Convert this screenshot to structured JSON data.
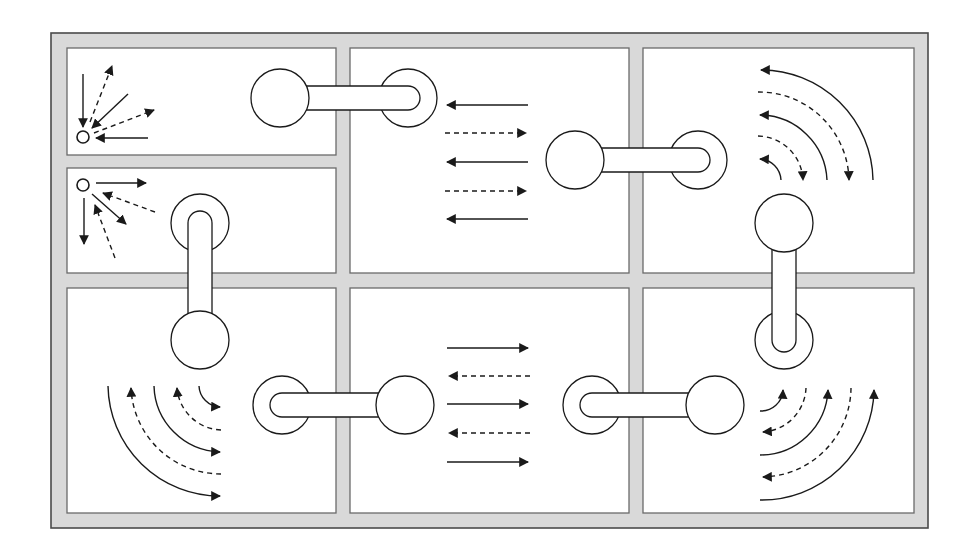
{
  "colors": {
    "background": "#ffffff",
    "frame_fill": "#d9d9d9",
    "frame_stroke": "#4a4a4a",
    "panel_fill": "#ffffff",
    "panel_stroke": "#6a6a6a",
    "line": "#1a1a1a"
  },
  "frame": {
    "x": 51,
    "y": 33,
    "w": 877,
    "h": 495
  },
  "panels": [
    {
      "id": "top-left-upper",
      "x": 67,
      "y": 48,
      "w": 269,
      "h": 107
    },
    {
      "id": "top-left-lower",
      "x": 67,
      "y": 168,
      "w": 269,
      "h": 105
    },
    {
      "id": "top-middle",
      "x": 350,
      "y": 48,
      "w": 279,
      "h": 225
    },
    {
      "id": "top-right",
      "x": 643,
      "y": 48,
      "w": 271,
      "h": 225
    },
    {
      "id": "bottom-left",
      "x": 67,
      "y": 288,
      "w": 269,
      "h": 225
    },
    {
      "id": "bottom-middle",
      "x": 350,
      "y": 288,
      "w": 279,
      "h": 225
    },
    {
      "id": "bottom-right",
      "x": 643,
      "y": 288,
      "w": 271,
      "h": 225
    }
  ],
  "rods": [
    {
      "id": "rod-top-horizontal-left",
      "orientation": "h",
      "ball": [
        280,
        98
      ],
      "ring": [
        408,
        98
      ],
      "r": 29,
      "half_width": 12
    },
    {
      "id": "rod-top-horizontal-right",
      "orientation": "h",
      "ball": [
        575,
        160
      ],
      "ring": [
        698,
        160
      ],
      "r": 29,
      "half_width": 12
    },
    {
      "id": "rod-left-vertical",
      "orientation": "v",
      "ball": [
        200,
        340
      ],
      "ring": [
        200,
        223
      ],
      "r": 29,
      "half_width": 12
    },
    {
      "id": "rod-right-vertical",
      "orientation": "v",
      "ball": [
        784,
        223
      ],
      "ring": [
        784,
        340
      ],
      "r": 29,
      "half_width": 12
    },
    {
      "id": "rod-bottom-horizontal-left",
      "orientation": "h",
      "ball": [
        405,
        405
      ],
      "ring": [
        282,
        405
      ],
      "r": 29,
      "half_width": 12
    },
    {
      "id": "rod-bottom-horizontal-right",
      "orientation": "h",
      "ball": [
        715,
        405
      ],
      "ring": [
        592,
        405
      ],
      "r": 29,
      "half_width": 12
    }
  ],
  "small_nodes": [
    {
      "id": "node-converging",
      "cx": 83,
      "cy": 137,
      "r": 6
    },
    {
      "id": "node-diverging",
      "cx": 83,
      "cy": 185,
      "r": 6
    }
  ],
  "arrows": [
    {
      "id": "tl-a1",
      "style": "solid",
      "path": "M83 74 L83 127"
    },
    {
      "id": "tl-a2",
      "style": "dashed",
      "path": "M90 122 L112 66"
    },
    {
      "id": "tl-a3",
      "style": "solid",
      "path": "M128 94 L92 128"
    },
    {
      "id": "tl-a4",
      "style": "dashed",
      "path": "M94 133 L154 110"
    },
    {
      "id": "tl-a5",
      "style": "solid",
      "path": "M148 138 L96 138"
    },
    {
      "id": "tl2-a1",
      "style": "solid",
      "path": "M96 183 L146 183"
    },
    {
      "id": "tl2-a2",
      "style": "dashed",
      "path": "M155 212 L103 193"
    },
    {
      "id": "tl2-a3",
      "style": "solid",
      "path": "M92 194 L126 224"
    },
    {
      "id": "tl2-a4",
      "style": "solid",
      "path": "M84 198 L84 244"
    },
    {
      "id": "tl2-a5",
      "style": "dashed",
      "path": "M115 258 L95 205"
    },
    {
      "id": "tm-a1",
      "style": "solid",
      "path": "M528 105 L447 105"
    },
    {
      "id": "tm-a2",
      "style": "dashed",
      "path": "M445 133 L526 133"
    },
    {
      "id": "tm-a3",
      "style": "solid",
      "path": "M528 162 L447 162"
    },
    {
      "id": "tm-a4",
      "style": "dashed",
      "path": "M445 191 L526 191"
    },
    {
      "id": "tm-a5",
      "style": "solid",
      "path": "M528 219 L447 219"
    },
    {
      "id": "tr-a1",
      "style": "solid",
      "path": "M873 180 A112 112 0 0 0 761 70"
    },
    {
      "id": "tr-a2",
      "style": "dashed",
      "path": "M758 92 A90 90 0 0 1 849 180"
    },
    {
      "id": "tr-a3",
      "style": "solid",
      "path": "M827 180 A68 68 0 0 0 760 115"
    },
    {
      "id": "tr-a4",
      "style": "dashed",
      "path": "M758 136 A46 46 0 0 1 803 180"
    },
    {
      "id": "tr-a5",
      "style": "solid",
      "path": "M781 180 A22 22 0 0 0 760 159"
    },
    {
      "id": "bl-a1",
      "style": "solid",
      "path": "M108 386 A112 112 0 0 0 220 496"
    },
    {
      "id": "bl-a2",
      "style": "dashed",
      "path": "M221 474 A90 90 0 0 1 131 388"
    },
    {
      "id": "bl-a3",
      "style": "solid",
      "path": "M154 386 A68 68 0 0 0 220 452"
    },
    {
      "id": "bl-a4",
      "style": "dashed",
      "path": "M221 430 A46 46 0 0 1 177 388"
    },
    {
      "id": "bl-a5",
      "style": "solid",
      "path": "M199 386 A22 22 0 0 0 220 407"
    },
    {
      "id": "bm-a1",
      "style": "solid",
      "path": "M447 348 L528 348"
    },
    {
      "id": "bm-a2",
      "style": "dashed",
      "path": "M530 376 L449 376"
    },
    {
      "id": "bm-a3",
      "style": "solid",
      "path": "M447 404 L528 404"
    },
    {
      "id": "bm-a4",
      "style": "dashed",
      "path": "M530 433 L449 433"
    },
    {
      "id": "bm-a5",
      "style": "solid",
      "path": "M447 462 L528 462"
    },
    {
      "id": "br-a1",
      "style": "solid",
      "path": "M760 500 A112 112 0 0 0 874 390"
    },
    {
      "id": "br-a2",
      "style": "dashed",
      "path": "M851 388 A90 90 0 0 1 763 477"
    },
    {
      "id": "br-a3",
      "style": "solid",
      "path": "M760 455 A68 68 0 0 0 828 390"
    },
    {
      "id": "br-a4",
      "style": "dashed",
      "path": "M806 388 A46 46 0 0 1 763 432"
    },
    {
      "id": "br-a5",
      "style": "solid",
      "path": "M760 411 A22 22 0 0 0 783 390"
    }
  ]
}
